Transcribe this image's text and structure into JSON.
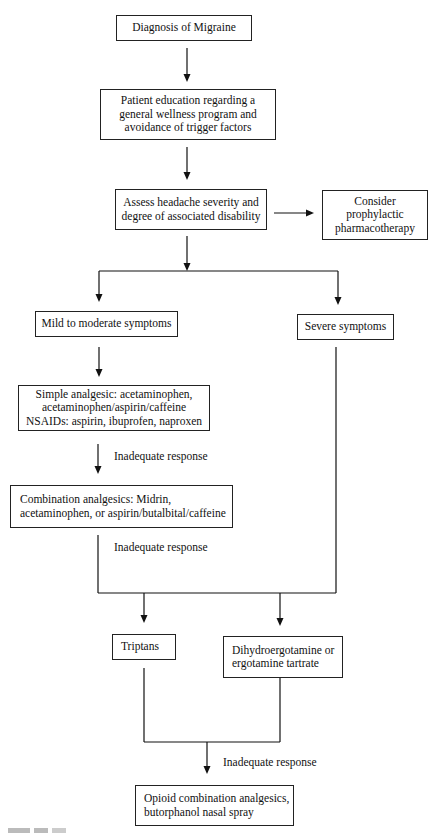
{
  "diagram": {
    "type": "flowchart",
    "nodes": {
      "diagnosis": "Diagnosis of Migraine",
      "education": "Patient education regarding a\ngeneral wellness program and\navoidance of trigger factors",
      "assess": "Assess headache severity and\ndegree of associated disability",
      "prophylactic": "Consider\nprophylactic\npharmacotherapy",
      "mild": "Mild to moderate symptoms",
      "severe": "Severe symptoms",
      "simple": "Simple analgesic: acetaminophen,\nacetaminophen/aspirin/caffeine\nNSAIDs: aspirin, ibuprofen, naproxen",
      "combination": "Combination analgesics:  Midrin,\nacetaminophen, or aspirin/butalbital/caffeine",
      "triptans": "Triptans",
      "dhe": "Dihydroergotamine or\nergotamine tartrate",
      "opioid": "Opioid combination analgesics,\nbutorphanol nasal spray"
    },
    "edge_labels": {
      "inadequate_1": "Inadequate response",
      "inadequate_2": "Inadequate response",
      "inadequate_3": "Inadequate response"
    },
    "edges": [
      [
        "diagnosis",
        "education"
      ],
      [
        "education",
        "assess"
      ],
      [
        "assess",
        "prophylactic"
      ],
      [
        "assess",
        "mild"
      ],
      [
        "assess",
        "severe"
      ],
      [
        "mild",
        "simple"
      ],
      [
        "simple",
        "combination",
        "Inadequate response"
      ],
      [
        "combination",
        "triptans",
        "Inadequate response"
      ],
      [
        "combination",
        "dhe",
        "Inadequate response"
      ],
      [
        "severe",
        "triptans"
      ],
      [
        "severe",
        "dhe"
      ],
      [
        "triptans",
        "opioid",
        "Inadequate response"
      ],
      [
        "dhe",
        "opioid",
        "Inadequate response"
      ]
    ]
  }
}
